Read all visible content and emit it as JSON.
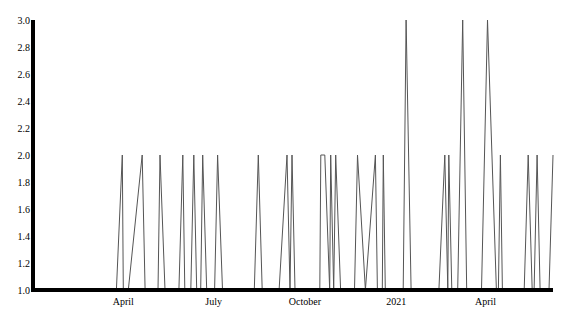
{
  "chart_data": {
    "type": "line",
    "title": "",
    "xlabel": "",
    "ylabel": "",
    "ylim": [
      1.0,
      3.0
    ],
    "xlim": [
      "2020-01-01",
      "2021-06-08"
    ],
    "grid": false,
    "legend": null,
    "yticks": [
      "1.0",
      "1.2",
      "1.4",
      "1.6",
      "1.8",
      "2.0",
      "2.2",
      "2.4",
      "2.6",
      "2.8",
      "3.0"
    ],
    "xticks": [
      {
        "label": "April",
        "date": "2020-04-01"
      },
      {
        "label": "July",
        "date": "2020-07-01"
      },
      {
        "label": "October",
        "date": "2020-10-01"
      },
      {
        "label": "2021",
        "date": "2021-01-01"
      },
      {
        "label": "April",
        "date": "2021-04-01"
      }
    ],
    "series": [
      {
        "name": "value",
        "color": "#555555",
        "points": [
          {
            "date": "2020-01-01",
            "value": 1
          },
          {
            "date": "2020-03-25",
            "value": 1
          },
          {
            "date": "2020-03-31",
            "value": 2
          },
          {
            "date": "2020-04-01",
            "value": 1
          },
          {
            "date": "2020-04-06",
            "value": 1
          },
          {
            "date": "2020-04-20",
            "value": 2
          },
          {
            "date": "2020-04-23",
            "value": 1
          },
          {
            "date": "2020-05-06",
            "value": 1
          },
          {
            "date": "2020-05-08",
            "value": 2
          },
          {
            "date": "2020-05-13",
            "value": 1
          },
          {
            "date": "2020-05-27",
            "value": 1
          },
          {
            "date": "2020-05-31",
            "value": 2
          },
          {
            "date": "2020-06-02",
            "value": 1
          },
          {
            "date": "2020-06-08",
            "value": 1
          },
          {
            "date": "2020-06-11",
            "value": 2
          },
          {
            "date": "2020-06-14",
            "value": 1
          },
          {
            "date": "2020-06-18",
            "value": 1
          },
          {
            "date": "2020-06-20",
            "value": 2
          },
          {
            "date": "2020-06-24",
            "value": 1
          },
          {
            "date": "2020-07-02",
            "value": 1
          },
          {
            "date": "2020-07-05",
            "value": 2
          },
          {
            "date": "2020-07-10",
            "value": 1
          },
          {
            "date": "2020-08-11",
            "value": 1
          },
          {
            "date": "2020-08-15",
            "value": 2
          },
          {
            "date": "2020-08-19",
            "value": 1
          },
          {
            "date": "2020-09-05",
            "value": 1
          },
          {
            "date": "2020-09-13",
            "value": 2
          },
          {
            "date": "2020-09-16",
            "value": 1
          },
          {
            "date": "2020-09-18",
            "value": 2
          },
          {
            "date": "2020-09-21",
            "value": 1
          },
          {
            "date": "2020-10-16",
            "value": 1
          },
          {
            "date": "2020-10-17",
            "value": 2
          },
          {
            "date": "2020-10-21",
            "value": 2
          },
          {
            "date": "2020-10-26",
            "value": 1
          },
          {
            "date": "2020-10-27",
            "value": 2
          },
          {
            "date": "2020-10-30",
            "value": 1
          },
          {
            "date": "2020-11-01",
            "value": 2
          },
          {
            "date": "2020-11-06",
            "value": 1
          },
          {
            "date": "2020-11-20",
            "value": 1
          },
          {
            "date": "2020-11-23",
            "value": 2
          },
          {
            "date": "2020-12-01",
            "value": 1
          },
          {
            "date": "2020-12-11",
            "value": 2
          },
          {
            "date": "2020-12-13",
            "value": 1
          },
          {
            "date": "2020-12-18",
            "value": 1
          },
          {
            "date": "2020-12-19",
            "value": 2
          },
          {
            "date": "2020-12-21",
            "value": 1
          },
          {
            "date": "2021-01-08",
            "value": 1
          },
          {
            "date": "2021-01-11",
            "value": 3
          },
          {
            "date": "2021-01-16",
            "value": 1
          },
          {
            "date": "2021-02-13",
            "value": 1
          },
          {
            "date": "2021-02-19",
            "value": 2
          },
          {
            "date": "2021-02-22",
            "value": 1
          },
          {
            "date": "2021-02-23",
            "value": 2
          },
          {
            "date": "2021-02-26",
            "value": 1
          },
          {
            "date": "2021-03-04",
            "value": 1
          },
          {
            "date": "2021-03-09",
            "value": 3
          },
          {
            "date": "2021-03-13",
            "value": 1
          },
          {
            "date": "2021-03-28",
            "value": 1
          },
          {
            "date": "2021-04-03",
            "value": 3
          },
          {
            "date": "2021-04-12",
            "value": 1
          },
          {
            "date": "2021-04-14",
            "value": 1
          },
          {
            "date": "2021-04-16",
            "value": 2
          },
          {
            "date": "2021-04-18",
            "value": 1
          },
          {
            "date": "2021-05-10",
            "value": 1
          },
          {
            "date": "2021-05-14",
            "value": 2
          },
          {
            "date": "2021-05-18",
            "value": 1
          },
          {
            "date": "2021-05-20",
            "value": 1
          },
          {
            "date": "2021-05-23",
            "value": 2
          },
          {
            "date": "2021-05-26",
            "value": 1
          },
          {
            "date": "2021-06-04",
            "value": 1
          },
          {
            "date": "2021-06-08",
            "value": 2
          }
        ]
      }
    ]
  },
  "layout": {
    "plot_left": 33,
    "plot_right": 553,
    "plot_top": 20,
    "plot_bottom": 290,
    "axis_color": "#000000",
    "line_color": "#555555",
    "background": "#ffffff"
  }
}
